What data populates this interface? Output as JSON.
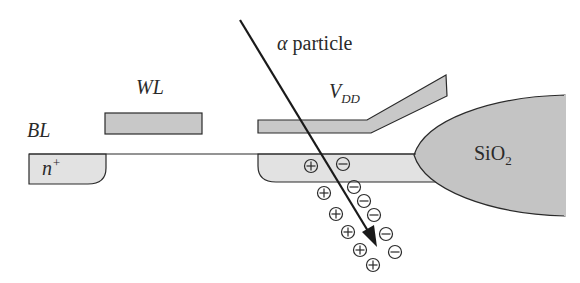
{
  "diagram": {
    "labels": {
      "alpha": "α",
      "particle": " particle",
      "wl": "WL",
      "bl": "BL",
      "vdd_main": "V",
      "vdd_sub": "DD",
      "nplus_main": "n",
      "nplus_sup": "+",
      "sio2_main": "SiO",
      "sio2_sub": "2"
    },
    "charges": [
      {
        "sign": "+",
        "x": 311,
        "y": 166
      },
      {
        "sign": "-",
        "x": 343,
        "y": 164
      },
      {
        "sign": "+",
        "x": 324,
        "y": 193
      },
      {
        "sign": "-",
        "x": 354,
        "y": 187
      },
      {
        "sign": "-",
        "x": 364,
        "y": 201
      },
      {
        "sign": "-",
        "x": 374,
        "y": 215
      },
      {
        "sign": "+",
        "x": 336,
        "y": 214
      },
      {
        "sign": "+",
        "x": 348,
        "y": 232
      },
      {
        "sign": "-",
        "x": 386,
        "y": 234
      },
      {
        "sign": "+",
        "x": 360,
        "y": 250
      },
      {
        "sign": "-",
        "x": 395,
        "y": 252
      },
      {
        "sign": "+",
        "x": 373,
        "y": 265
      }
    ],
    "colors": {
      "stroke": "#2a2a2a",
      "gate_fill": "#c8c8c8",
      "diffusion_fill": "#e2e2e2",
      "oxide_fill": "#c4c4c4"
    }
  }
}
